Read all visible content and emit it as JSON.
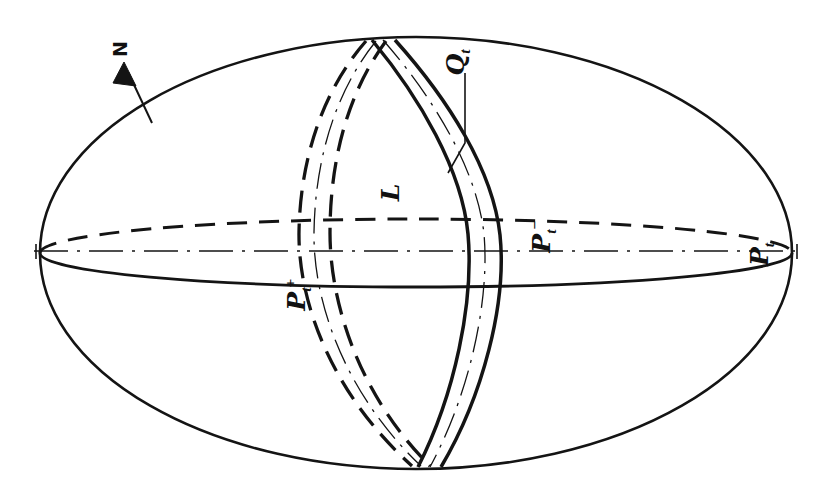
{
  "figure": {
    "kind": "line-diagram",
    "caption_present": false,
    "background_color": "#ffffff",
    "ink_color": "#111111",
    "width_px": 831,
    "height_px": 502
  },
  "labels": {
    "north_pole": {
      "text": "N",
      "name": "north-direction-label",
      "rotated": true,
      "has_arrow": true
    },
    "band_front": {
      "glyph": "Q",
      "subscript": "t",
      "superscript": "",
      "full": "Q t",
      "name": "band-Qt-label",
      "rotated": true,
      "has_leader": true
    },
    "band_region": {
      "glyph": "L",
      "subscript": "",
      "superscript": "",
      "full": "L",
      "name": "region-L-label",
      "rotated": true,
      "has_leader": false
    },
    "plane_plus": {
      "glyph": "P",
      "subscript": "t",
      "superscript": "+",
      "full": "P t +",
      "name": "plane-Pt-plus-label",
      "rotated": true,
      "has_leader": false
    },
    "plane_minus": {
      "glyph": "P",
      "subscript": "t",
      "superscript": "−",
      "full": "P t −",
      "name": "plane-Pt-minus-label",
      "rotated": true,
      "has_leader": false
    },
    "plane_t": {
      "glyph": "P",
      "subscript": "t",
      "superscript": "",
      "full": "P t",
      "name": "plane-Pt-label",
      "rotated": true,
      "has_leader": false
    }
  },
  "geometry": {
    "sphere_outline": {
      "name": "sphere-outline",
      "type": "ellipse",
      "cx": 416,
      "cy": 253,
      "rx": 376,
      "ry": 216,
      "stroke_width": 2.6,
      "style": "solid"
    },
    "equator": {
      "name": "equator-ellipse",
      "type": "ellipse",
      "cx": 416,
      "cy": 253,
      "rx": 376,
      "ry": 34,
      "back_half_style": "dashed",
      "front_half_style": "solid",
      "stroke_width": 2.6
    },
    "polar_axis": {
      "name": "polar-axis-line",
      "type": "line",
      "x1": 34,
      "y1": 251,
      "x2": 800,
      "y2": 251,
      "style": "dash-dot",
      "stroke_width": 1.4
    },
    "bands": [
      {
        "name": "meridian-band-back",
        "style": "dashed",
        "stroke_width": 3.2,
        "center_line_style": "dash-dot"
      },
      {
        "name": "meridian-band-front",
        "style": "solid",
        "stroke_width": 3.4,
        "center_line_style": "dash-dot"
      }
    ]
  }
}
